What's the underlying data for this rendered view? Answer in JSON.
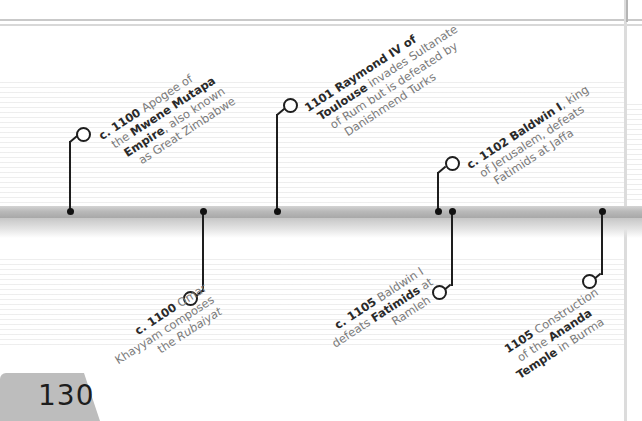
{
  "page": {
    "number": "130",
    "background": "#ffffff",
    "bar_color": "#b9b9b9",
    "text_color": "#7a7a7a",
    "bold_color": "#2a2a2a"
  },
  "timeline": {
    "above": [
      {
        "date": "c. 1100",
        "lines": [
          {
            "pre": "",
            "bold": "c. 1100",
            "post": " Apogee of"
          },
          {
            "pre": "the ",
            "bold": "Mwene Mutapa",
            "post": ""
          },
          {
            "pre": "",
            "bold": "Empire",
            "post": ", also known"
          },
          {
            "pre": "as Great Zimbabwe",
            "bold": "",
            "post": ""
          }
        ]
      },
      {
        "date": "1101",
        "lines": [
          {
            "pre": "",
            "bold": "1101 Raymond IV of",
            "post": ""
          },
          {
            "pre": "",
            "bold": "Toulouse",
            "post": " invades Sultanate"
          },
          {
            "pre": "of Rum but is defeated by",
            "bold": "",
            "post": ""
          },
          {
            "pre": "Danishmend Turks",
            "bold": "",
            "post": ""
          }
        ]
      },
      {
        "date": "c. 1102",
        "lines": [
          {
            "pre": "",
            "bold": "c. 1102 Baldwin I",
            "post": ", king"
          },
          {
            "pre": "of Jerusalem, defeats",
            "bold": "",
            "post": ""
          },
          {
            "pre": "Fatimids at Jaffa",
            "bold": "",
            "post": ""
          }
        ]
      }
    ],
    "below": [
      {
        "date": "c. 1100",
        "lines": [
          {
            "pre": "",
            "bold": "c. 1100",
            "post": " Omar"
          },
          {
            "pre": "Khayyam composes",
            "bold": "",
            "post": ""
          },
          {
            "pre": "the ",
            "bold": "",
            "post": "",
            "italic": "Rubaiyat"
          }
        ]
      },
      {
        "date": "c. 1105",
        "lines": [
          {
            "pre": "",
            "bold": "c. 1105",
            "post": " Baldwin I"
          },
          {
            "pre": "defeats ",
            "bold": "Fatimids",
            "post": " at"
          },
          {
            "pre": "Ramleh",
            "bold": "",
            "post": ""
          }
        ]
      },
      {
        "date": "1105",
        "lines": [
          {
            "pre": "",
            "bold": "1105",
            "post": " Construction"
          },
          {
            "pre": "of the ",
            "bold": "Ananda",
            "post": ""
          },
          {
            "pre": "",
            "bold": "Temple",
            "post": " in Burma"
          }
        ]
      }
    ]
  }
}
